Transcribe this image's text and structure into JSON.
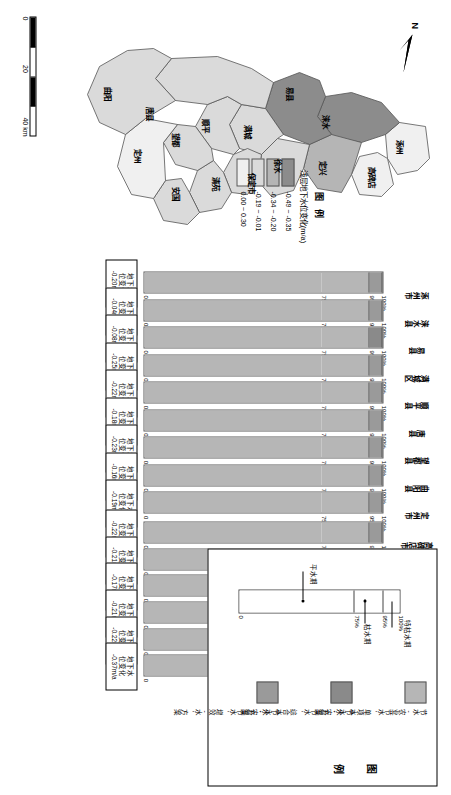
{
  "figure": {
    "map": {
      "north_label": "N",
      "scale": {
        "ticks": [
          "0",
          "20",
          "40 km"
        ]
      },
      "legend": {
        "title": "图 例",
        "subtitle": "浅层地下水位变化(m/a)",
        "items": [
          {
            "label": "-0.49 ~ -0.35",
            "color": "#8c8c8c"
          },
          {
            "label": "-0.34 ~ -0.20",
            "color": "#b5b5b5"
          },
          {
            "label": "-0.19 ~ -0.01",
            "color": "#dadada"
          },
          {
            "label": "0.00 ~ 0.30",
            "color": "#f0f0f0"
          }
        ]
      },
      "counties": [
        {
          "name": "涿州",
          "x": 131,
          "y": 38
        },
        {
          "name": "高碑店",
          "x": 158,
          "y": 66
        },
        {
          "name": "定兴",
          "x": 152,
          "y": 115
        },
        {
          "name": "涞水",
          "x": 106,
          "y": 112
        },
        {
          "name": "易县",
          "x": 78,
          "y": 148
        },
        {
          "name": "徐水",
          "x": 150,
          "y": 160
        },
        {
          "name": "满城",
          "x": 116,
          "y": 190
        },
        {
          "name": "保定市",
          "x": 164,
          "y": 186
        },
        {
          "name": "清苑",
          "x": 168,
          "y": 222
        },
        {
          "name": "安国",
          "x": 178,
          "y": 262
        },
        {
          "name": "顺平",
          "x": 110,
          "y": 232
        },
        {
          "name": "望都",
          "x": 124,
          "y": 262
        },
        {
          "name": "唐县",
          "x": 98,
          "y": 288
        },
        {
          "name": "定州",
          "x": 140,
          "y": 300
        },
        {
          "name": "曲阳",
          "x": 78,
          "y": 330
        }
      ]
    },
    "axis_ticks": [
      "0",
      "75%",
      "95%",
      "100%"
    ],
    "bar_groups": [
      {
        "id": "col-mid",
        "bars": [
          {
            "city": "涿州市",
            "note_l1": "地下水",
            "note_l2": "位变化",
            "note_l3": "-0.20m/a",
            "seg_normal": 75,
            "seg_dry": 20,
            "seg_xdry": 5,
            "highlight": false
          },
          {
            "city": "涞水县",
            "note_l1": "地下水",
            "note_l2": "位变化",
            "note_l3": "-0.04m/a",
            "seg_normal": 75,
            "seg_dry": 20,
            "seg_xdry": 5,
            "highlight": false
          },
          {
            "city": "易县",
            "note_l1": "地下水",
            "note_l2": "位变化",
            "note_l3": "-0.08m/a",
            "seg_normal": 75,
            "seg_dry": 20,
            "seg_xdry": 5,
            "highlight": true
          },
          {
            "city": "满城区",
            "note_l1": "地下水",
            "note_l2": "位变化",
            "note_l3": "-0.25m/a",
            "seg_normal": 75,
            "seg_dry": 20,
            "seg_xdry": 5,
            "highlight": false
          },
          {
            "city": "顺平县",
            "note_l1": "地下水",
            "note_l2": "位变化",
            "note_l3": "-0.22m/a",
            "seg_normal": 75,
            "seg_dry": 20,
            "seg_xdry": 5,
            "highlight": false
          },
          {
            "city": "唐县",
            "note_l1": "地下水",
            "note_l2": "位变化",
            "note_l3": "-0.18m/a",
            "seg_normal": 75,
            "seg_dry": 20,
            "seg_xdry": 5,
            "highlight": false
          },
          {
            "city": "望都县",
            "note_l1": "地下水",
            "note_l2": "位变化",
            "note_l3": "-0.23m/a",
            "seg_normal": 75,
            "seg_dry": 20,
            "seg_xdry": 5,
            "highlight": false
          },
          {
            "city": "曲阳县",
            "note_l1": "地下水",
            "note_l2": "位变化",
            "note_l3": "-0.16m/a",
            "seg_normal": 75,
            "seg_dry": 20,
            "seg_xdry": 5,
            "highlight": false
          },
          {
            "city": "定州市",
            "note_l1": "地下水",
            "note_l2": "位变化",
            "note_l3": "-0.19m/a",
            "seg_normal": 75,
            "seg_dry": 20,
            "seg_xdry": 5,
            "highlight": false
          }
        ]
      },
      {
        "id": "col-right",
        "bars": [
          {
            "city": "高碑店市",
            "note_l1": "地下水",
            "note_l2": "位变化",
            "note_l3": "-0.22m/a",
            "seg_normal": 75,
            "seg_dry": 20,
            "seg_xdry": 5,
            "highlight": false
          },
          {
            "city": "定兴县",
            "note_l1": "地下水",
            "note_l2": "位变化",
            "note_l3": "-0.21m/a",
            "seg_normal": 75,
            "seg_dry": 20,
            "seg_xdry": 5,
            "highlight": false
          },
          {
            "city": "徐水区",
            "note_l1": "地下水",
            "note_l2": "位变化",
            "note_l3": "-0.17m/a",
            "seg_normal": 75,
            "seg_dry": 20,
            "seg_xdry": 5,
            "highlight": false
          },
          {
            "city": "保定市",
            "note_l1": "地下水",
            "note_l2": "位变化",
            "note_l3": "-0.21m/a",
            "seg_normal": 75,
            "seg_dry": 20,
            "seg_xdry": 5,
            "highlight": false
          },
          {
            "city": "清苑区",
            "note_l1": "地下水",
            "note_l2": "位变化",
            "note_l3": "-0.22m/a",
            "seg_normal": 75,
            "seg_dry": 20,
            "seg_xdry": 5,
            "highlight": false
          },
          {
            "city": "安国市",
            "note_l1": "地下水",
            "note_l2": "位变化",
            "note_l3": "-0.37m/a",
            "seg_normal": 75,
            "seg_dry": 20,
            "seg_xdry": 5,
            "highlight": false
          }
        ]
      }
    ],
    "legend_box": {
      "title": "图 例",
      "schematic": {
        "ticks": [
          "0",
          "75%",
          "95%",
          "100%"
        ],
        "annotations": [
          "平水期",
          "枯水期",
          "特枯水期"
        ]
      },
      "items": [
        {
          "color": "#b6b6b6",
          "text": "节水-农业节水'单项水-水'方案"
        },
        {
          "color": "#8a8a8a",
          "text": "节水-农业节水'综合水-水'方案"
        },
        {
          "color": "#9a9a9a",
          "text": "节水-农业节水'增效-水'方案"
        }
      ]
    }
  }
}
